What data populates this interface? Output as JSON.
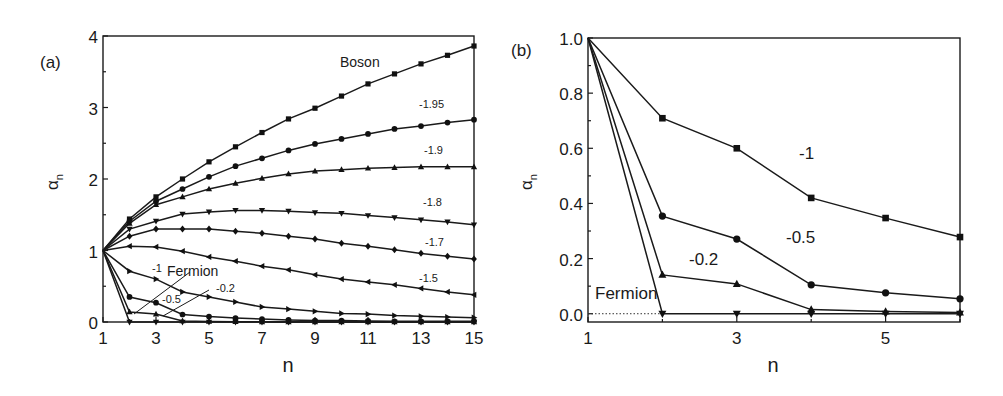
{
  "figure": {
    "panels": [
      "(a)",
      "(b)"
    ]
  },
  "chart_data": [
    {
      "panel_label": "(a)",
      "type": "line",
      "title": "",
      "xlabel": "n",
      "ylabel": "α_n",
      "ylabel_main": "α",
      "ylabel_sub": "n",
      "xlim": [
        1,
        15
      ],
      "ylim": [
        0,
        4
      ],
      "xticks": [
        1,
        3,
        5,
        7,
        9,
        11,
        13,
        15
      ],
      "xticks_minor": [
        2,
        4,
        6,
        8,
        10,
        12,
        14
      ],
      "yticks": [
        0,
        1,
        2,
        3,
        4
      ],
      "yticks_minor": [
        0.5,
        1.5,
        2.5,
        3.5
      ],
      "grid": false,
      "legend": "inline labels",
      "x": [
        1,
        2,
        3,
        4,
        5,
        6,
        7,
        8,
        9,
        10,
        11,
        12,
        13,
        14,
        15
      ],
      "series": [
        {
          "name": "Boson",
          "marker": "square",
          "values": [
            1.0,
            1.44,
            1.75,
            2.0,
            2.24,
            2.45,
            2.65,
            2.84,
            2.99,
            3.16,
            3.33,
            3.47,
            3.61,
            3.73,
            3.86
          ]
        },
        {
          "name": "-1.95",
          "marker": "circle",
          "values": [
            1.0,
            1.41,
            1.69,
            1.86,
            2.03,
            2.18,
            2.29,
            2.4,
            2.49,
            2.56,
            2.63,
            2.7,
            2.74,
            2.79,
            2.83
          ]
        },
        {
          "name": "-1.9",
          "marker": "triangle-up",
          "values": [
            1.0,
            1.38,
            1.64,
            1.75,
            1.86,
            1.94,
            2.01,
            2.07,
            2.11,
            2.13,
            2.15,
            2.16,
            2.17,
            2.17,
            2.17
          ]
        },
        {
          "name": "-1.8",
          "marker": "triangle-down",
          "values": [
            1.0,
            1.3,
            1.41,
            1.51,
            1.54,
            1.56,
            1.56,
            1.55,
            1.53,
            1.52,
            1.49,
            1.46,
            1.43,
            1.4,
            1.36
          ]
        },
        {
          "name": "-1.7",
          "marker": "diamond",
          "values": [
            1.0,
            1.2,
            1.3,
            1.3,
            1.3,
            1.27,
            1.24,
            1.2,
            1.16,
            1.1,
            1.06,
            1.01,
            0.96,
            0.92,
            0.88
          ]
        },
        {
          "name": "-1.5",
          "marker": "triangle-left",
          "values": [
            1.0,
            1.06,
            1.05,
            0.99,
            0.91,
            0.85,
            0.78,
            0.73,
            0.66,
            0.6,
            0.56,
            0.52,
            0.47,
            0.42,
            0.38
          ]
        },
        {
          "name": "-1",
          "marker": "triangle-right",
          "values": [
            1.0,
            0.71,
            0.6,
            0.42,
            0.35,
            0.28,
            0.21,
            0.18,
            0.15,
            0.12,
            0.11,
            0.09,
            0.08,
            0.07,
            0.06
          ]
        },
        {
          "name": "-0.5",
          "marker": "circle",
          "values": [
            1.0,
            0.35,
            0.27,
            0.105,
            0.076,
            0.054,
            0.04,
            0.03,
            0.02,
            0.02,
            0.015,
            0.01,
            0.01,
            0.01,
            0.01
          ]
        },
        {
          "name": "-0.2",
          "marker": "triangle-up",
          "values": [
            1.0,
            0.14,
            0.11,
            0.015,
            0.008,
            0.004,
            0.003,
            0.002,
            0.002,
            0.001,
            0.001,
            0.001,
            0.001,
            0.001,
            0.001
          ]
        },
        {
          "name": "Fermion",
          "marker": "triangle-down",
          "values": [
            1.0,
            0.0,
            0.0,
            0.0,
            0.0,
            0.0,
            0.0,
            0.0,
            0.0,
            0.0,
            0.0,
            0.0,
            0.0,
            0.0,
            0.0
          ]
        }
      ],
      "annotations": [
        {
          "text": "Boson",
          "x_px": 340,
          "y_px": 67,
          "size": 14
        },
        {
          "text": "-1.95",
          "x_px": 419,
          "y_px": 108,
          "size": 11
        },
        {
          "text": "-1.9",
          "x_px": 424,
          "y_px": 154,
          "size": 11
        },
        {
          "text": "-1.8",
          "x_px": 423,
          "y_px": 206,
          "size": 11
        },
        {
          "text": "-1.7",
          "x_px": 425,
          "y_px": 246,
          "size": 11
        },
        {
          "text": "-1.5",
          "x_px": 419,
          "y_px": 282,
          "size": 11
        },
        {
          "text": "-1",
          "x_px": 152,
          "y_px": 272,
          "size": 11
        },
        {
          "text": "Fermion",
          "x_px": 167,
          "y_px": 276,
          "size": 14
        },
        {
          "text": "-0.2",
          "x_px": 216,
          "y_px": 292,
          "size": 11
        },
        {
          "text": "-0.5",
          "x_px": 162,
          "y_px": 303,
          "size": 11
        }
      ]
    },
    {
      "panel_label": "(b)",
      "type": "line",
      "title": "",
      "xlabel": "n",
      "ylabel": "α_n",
      "ylabel_main": "α",
      "ylabel_sub": "n",
      "xlim": [
        1,
        6
      ],
      "ylim": [
        -0.03,
        1.0
      ],
      "xticks": [
        1,
        3,
        5
      ],
      "xticks_minor": [
        2,
        4,
        6
      ],
      "yticks": [
        0.0,
        0.2,
        0.4,
        0.6,
        0.8,
        1.0
      ],
      "ytick_labels": [
        "0.0",
        "0.2",
        "0.4",
        "0.6",
        "0.8",
        "1.0"
      ],
      "yticks_minor": [
        0.1,
        0.3,
        0.5,
        0.7,
        0.9
      ],
      "grid": false,
      "legend": "inline labels",
      "reference_line": {
        "style": "dotted",
        "y": 0.0,
        "x_from": 1,
        "x_to": 2
      },
      "x": [
        1,
        2,
        3,
        4,
        5,
        6
      ],
      "series": [
        {
          "name": "-1",
          "marker": "square",
          "values": [
            1.0,
            0.709,
            0.6,
            0.42,
            0.347,
            0.278
          ]
        },
        {
          "name": "-0.5",
          "marker": "circle",
          "values": [
            1.0,
            0.354,
            0.271,
            0.105,
            0.076,
            0.054
          ]
        },
        {
          "name": "-0.2",
          "marker": "triangle-up",
          "values": [
            1.0,
            0.141,
            0.108,
            0.015,
            0.008,
            0.004
          ]
        },
        {
          "name": "Fermion",
          "marker": "triangle-down",
          "values": [
            1.0,
            0.0,
            0.0,
            0.0,
            0.0,
            0.0
          ]
        }
      ],
      "annotations": [
        {
          "text": "-1",
          "x_px": 799,
          "y_px": 159,
          "size": 17
        },
        {
          "text": "-0.5",
          "x_px": 786,
          "y_px": 243,
          "size": 17
        },
        {
          "text": "-0.2",
          "x_px": 689,
          "y_px": 265,
          "size": 17
        },
        {
          "text": "Fermion",
          "x_px": 595,
          "y_px": 299,
          "size": 17
        }
      ]
    }
  ]
}
